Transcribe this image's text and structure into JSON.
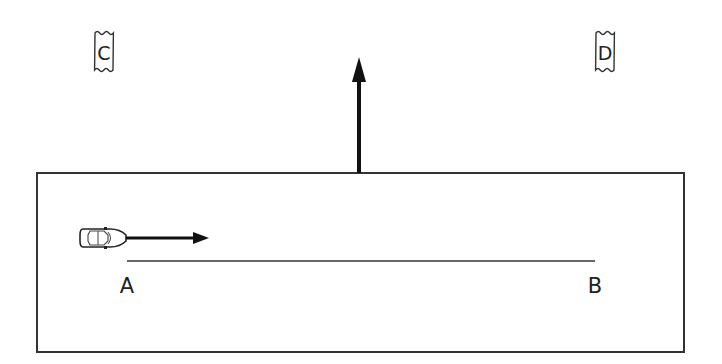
{
  "diagram": {
    "type": "physics-scenario",
    "region": {
      "left": 37,
      "top": 173,
      "right": 684,
      "bottom": 352
    },
    "points": [
      {
        "id": "A",
        "label": "A",
        "x": 127,
        "y": 287
      },
      {
        "id": "B",
        "label": "B",
        "x": 595,
        "y": 287
      }
    ],
    "path_line": {
      "from": "A",
      "to": "B",
      "y": 261,
      "x1": 127,
      "x2": 595
    },
    "car": {
      "direction": "right",
      "x": 80,
      "y": 227,
      "velocity_arrow_to_x": 208
    },
    "force_arrow": {
      "direction": "up",
      "x": 359,
      "y_from": 173,
      "y_to": 58
    },
    "tags": [
      {
        "id": "C",
        "label": "C",
        "x": 104,
        "y": 30
      },
      {
        "id": "D",
        "label": "D",
        "x": 596,
        "y": 30
      }
    ]
  }
}
